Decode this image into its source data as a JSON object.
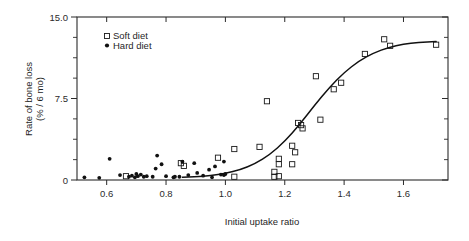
{
  "chart_data": {
    "type": "scatter",
    "title": "",
    "xlabel": "Initial uptake ratio",
    "ylabel": "Rate of bone loss\n(% / 6 mo)",
    "ylabel_line1": "Rate of bone loss",
    "ylabel_line2": "(% / 6 mo)",
    "xlim": [
      0.5,
      1.75
    ],
    "ylim": [
      0,
      15.0
    ],
    "xticks": [
      0.6,
      0.8,
      1.0,
      1.2,
      1.4,
      1.6
    ],
    "xtick_labels": [
      "0.6",
      "0.8",
      "1.0",
      "1.2",
      "1.4",
      "1.6"
    ],
    "yticks": [
      0,
      7.5,
      15.0
    ],
    "ytick_labels": [
      "0",
      "7.5",
      "15.0"
    ],
    "yminor_ticks": [
      1.875,
      3.75,
      5.625,
      9.375,
      11.25,
      13.125
    ],
    "grid": false,
    "legend_position": "top-left",
    "frame": "box",
    "series": [
      {
        "name": "Soft diet",
        "marker": "open-square",
        "points": [
          [
            0.665,
            0.35
          ],
          [
            0.85,
            1.55
          ],
          [
            0.86,
            1.3
          ],
          [
            0.975,
            2.05
          ],
          [
            1.03,
            0.3
          ],
          [
            1.03,
            2.85
          ],
          [
            1.115,
            3.05
          ],
          [
            1.14,
            7.25
          ],
          [
            1.165,
            0.3
          ],
          [
            1.165,
            0.75
          ],
          [
            1.18,
            0.35
          ],
          [
            1.18,
            1.45
          ],
          [
            1.18,
            1.95
          ],
          [
            1.225,
            3.15
          ],
          [
            1.225,
            1.45
          ],
          [
            1.235,
            2.55
          ],
          [
            1.245,
            5.25
          ],
          [
            1.255,
            5.05
          ],
          [
            1.26,
            4.75
          ],
          [
            1.305,
            9.55
          ],
          [
            1.32,
            5.55
          ],
          [
            1.365,
            8.35
          ],
          [
            1.39,
            8.95
          ],
          [
            1.47,
            11.6
          ],
          [
            1.535,
            12.95
          ],
          [
            1.555,
            12.35
          ],
          [
            1.71,
            12.45
          ]
        ]
      },
      {
        "name": "Hard diet",
        "marker": "filled-circle",
        "points": [
          [
            0.525,
            0.25
          ],
          [
            0.575,
            0.2
          ],
          [
            0.61,
            1.95
          ],
          [
            0.645,
            0.45
          ],
          [
            0.675,
            0.3
          ],
          [
            0.685,
            0.4
          ],
          [
            0.695,
            0.25
          ],
          [
            0.7,
            0.55
          ],
          [
            0.705,
            0.35
          ],
          [
            0.715,
            0.5
          ],
          [
            0.725,
            0.3
          ],
          [
            0.735,
            0.35
          ],
          [
            0.755,
            0.3
          ],
          [
            0.765,
            1.05
          ],
          [
            0.77,
            2.25
          ],
          [
            0.785,
            1.45
          ],
          [
            0.8,
            0.35
          ],
          [
            0.825,
            0.25
          ],
          [
            0.83,
            0.3
          ],
          [
            0.845,
            0.3
          ],
          [
            0.855,
            1.7
          ],
          [
            0.875,
            0.45
          ],
          [
            0.895,
            1.55
          ],
          [
            0.905,
            0.65
          ],
          [
            0.925,
            0.4
          ],
          [
            0.945,
            0.95
          ],
          [
            0.955,
            0.25
          ],
          [
            0.965,
            1.25
          ],
          [
            0.985,
            0.5
          ],
          [
            0.995,
            0.45
          ],
          [
            0.995,
            1.7
          ],
          [
            1.0,
            0.55
          ]
        ]
      }
    ],
    "fit_curve": {
      "name": "sigmoid fit",
      "points": [
        [
          0.855,
          0.25
        ],
        [
          0.9,
          0.3
        ],
        [
          0.95,
          0.4
        ],
        [
          1.0,
          0.6
        ],
        [
          1.05,
          0.95
        ],
        [
          1.1,
          1.5
        ],
        [
          1.15,
          2.35
        ],
        [
          1.2,
          3.55
        ],
        [
          1.25,
          5.1
        ],
        [
          1.3,
          6.85
        ],
        [
          1.35,
          8.5
        ],
        [
          1.4,
          9.9
        ],
        [
          1.45,
          10.95
        ],
        [
          1.5,
          11.7
        ],
        [
          1.55,
          12.2
        ],
        [
          1.6,
          12.5
        ],
        [
          1.65,
          12.65
        ],
        [
          1.71,
          12.75
        ]
      ]
    },
    "legend": [
      {
        "label": "Soft diet",
        "marker": "open-square"
      },
      {
        "label": "Hard diet",
        "marker": "filled-circle"
      }
    ]
  }
}
